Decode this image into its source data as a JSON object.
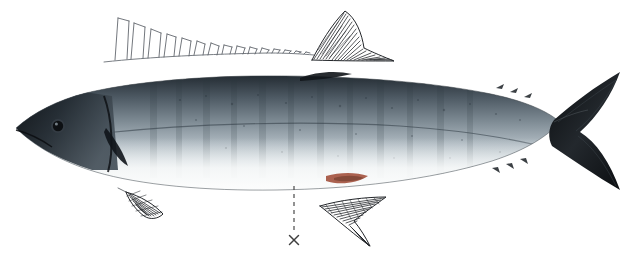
{
  "figure": {
    "kind": "scientific-fish-plate",
    "background_color": "#ffffff",
    "width": 631,
    "height": 264,
    "subject": "mackerel",
    "orientation": "left-facing lateral view",
    "caption": "",
    "labels": []
  },
  "annotations": {
    "leader_line": {
      "name": "dashed-leader-line",
      "style": "dashed",
      "color": "#4a4a4a",
      "x": 294,
      "y_top": 186,
      "y_bottom": 232,
      "dash_pattern": "4 4",
      "width": 1.2
    },
    "cross_mark": {
      "name": "x-mark",
      "glyph": "×",
      "color": "#3f3f3f",
      "x": 294,
      "y": 240,
      "size": 11
    }
  },
  "fish_body": {
    "name": "fish-photograph",
    "bounds": {
      "x": 14,
      "y": 74,
      "width": 606,
      "height": 118
    },
    "colors": {
      "dorsal_dark": "#2a3138",
      "dorsal_midnight": "#171c22",
      "flank_steel": "#6f7b85",
      "flank_silver": "#b9c3ca",
      "belly_white": "#f2f4f5",
      "belly_shadow": "#d4dade",
      "fin_black": "#16191c",
      "anal_red": "#a04a33",
      "eye_black": "#101316",
      "outline": "#343a40"
    },
    "head": {
      "snout_x": 16,
      "eye_x": 58,
      "eye_y": 126,
      "eye_r": 6.5
    },
    "caudal": {
      "peduncle_x": 556,
      "tip_x": 624,
      "upper_y": 74,
      "lower_y": 206
    }
  },
  "fin_drawings": [
    {
      "name": "first-dorsal-fin-drawing",
      "type": "spiny-dorsal",
      "style": "ink-line-drawing",
      "stroke": "#5a5f66",
      "spine_count": 22,
      "base": {
        "x_start": 104,
        "y_start": 58,
        "x_end": 312,
        "y_end": 54
      },
      "tallest_spine_height": 42,
      "shortest_spine_height": 5
    },
    {
      "name": "second-dorsal-fin-drawing",
      "type": "soft-dorsal",
      "style": "hatched-ink-drawing",
      "stroke": "#1d2024",
      "hatch_count": 26,
      "apex": {
        "x": 346,
        "y": 10
      },
      "base": {
        "x_start": 312,
        "y_start": 58,
        "x_end": 392,
        "y_end": 62
      }
    },
    {
      "name": "pelvic-fin-drawing",
      "type": "pelvic",
      "style": "crosshatched-ink-drawing",
      "stroke": "#23262a",
      "hatch_count": 16,
      "bounds": {
        "x": 124,
        "y": 190,
        "width": 46,
        "height": 30
      }
    },
    {
      "name": "anal-fin-drawing",
      "type": "anal",
      "style": "hatched-ink-drawing",
      "stroke": "#1d2024",
      "hatch_count": 24,
      "apex": {
        "x": 386,
        "y": 198
      },
      "bounds": {
        "x": 318,
        "y": 196,
        "width": 72,
        "height": 50
      }
    }
  ]
}
